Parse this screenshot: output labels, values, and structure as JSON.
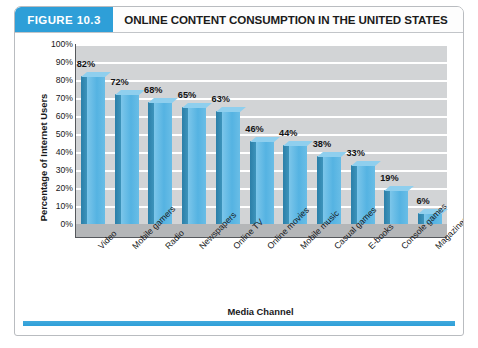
{
  "figure": {
    "tag": "FIGURE 10.3",
    "title": "ONLINE CONTENT CONSUMPTION IN THE UNITED STATES",
    "accent_color": "#2e9fd8",
    "bar_color": "#55b3e2",
    "bar_side_color": "#2b7fa8",
    "plot_bg_color": "#d2d4d6"
  },
  "chart_data": {
    "type": "bar",
    "title": "ONLINE CONTENT CONSUMPTION IN THE UNITED STATES",
    "xlabel": "Media Channel",
    "ylabel": "Percentage of Internet Users",
    "ylim": [
      0,
      100
    ],
    "yticks": [
      "0%",
      "10%",
      "20%",
      "30%",
      "40%",
      "50%",
      "60%",
      "70%",
      "80%",
      "90%",
      "100%"
    ],
    "grid": true,
    "legend": "none",
    "categories": [
      "Video",
      "Mobile gamers",
      "Radio",
      "Newspapers",
      "Online TV",
      "Online movies",
      "Mobile music",
      "Casual games",
      "E-books",
      "Console games",
      "Magazines"
    ],
    "values": [
      82,
      72,
      68,
      65,
      63,
      46,
      44,
      38,
      33,
      19,
      6
    ],
    "data_labels": [
      "82%",
      "72%",
      "68%",
      "65%",
      "63%",
      "46%",
      "44%",
      "38%",
      "33%",
      "19%",
      "6%"
    ]
  }
}
